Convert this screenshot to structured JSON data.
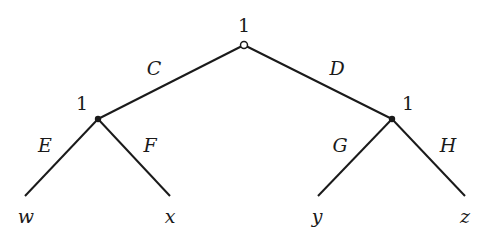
{
  "diagram": {
    "type": "game-tree",
    "root": {
      "player": "1",
      "node_style": "open-circle"
    },
    "left_node": {
      "player": "1",
      "node_style": "filled-dot"
    },
    "right_node": {
      "player": "1",
      "node_style": "filled-dot"
    },
    "edges": {
      "root_left": "C",
      "root_right": "D",
      "left_left": "E",
      "left_right": "F",
      "right_left": "G",
      "right_right": "H"
    },
    "leaves": [
      "w",
      "x",
      "y",
      "z"
    ]
  }
}
